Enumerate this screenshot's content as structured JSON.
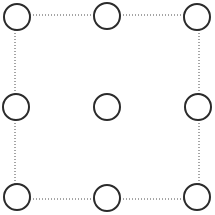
{
  "figure": {
    "name": "nine-point-dotted-square",
    "canvas": {
      "width": 215,
      "height": 215,
      "background_color": "#ffffff"
    },
    "square": {
      "label": "dotted-square-boundary",
      "left": 15,
      "top": 15,
      "right": 199,
      "bottom": 199,
      "stroke_color": "#4a4a4a",
      "stroke_width": 1,
      "dash_pattern": "1 2",
      "edges": [
        {
          "name": "top-edge",
          "x1": 15,
          "y1": 15,
          "x2": 199,
          "y2": 15
        },
        {
          "name": "right-edge",
          "x1": 199,
          "y1": 15,
          "x2": 199,
          "y2": 199
        },
        {
          "name": "bottom-edge",
          "x1": 15,
          "y1": 199,
          "x2": 199,
          "y2": 199
        },
        {
          "name": "left-edge",
          "x1": 15,
          "y1": 15,
          "x2": 15,
          "y2": 199
        }
      ]
    },
    "nodes": {
      "count": 9,
      "grid_rows": 3,
      "grid_cols": 3,
      "radius": 13,
      "stroke_color": "#2b2b2b",
      "stroke_width": 2,
      "fill_color": "#ffffff",
      "items": [
        {
          "id": "node-top-left",
          "row": 0,
          "col": 0,
          "cx": 17,
          "cy": 17,
          "on_boundary": true
        },
        {
          "id": "node-top-center",
          "row": 0,
          "col": 1,
          "cx": 107,
          "cy": 16,
          "on_boundary": true
        },
        {
          "id": "node-top-right",
          "row": 0,
          "col": 2,
          "cx": 197,
          "cy": 17,
          "on_boundary": true
        },
        {
          "id": "node-middle-left",
          "row": 1,
          "col": 0,
          "cx": 16,
          "cy": 107,
          "on_boundary": true
        },
        {
          "id": "node-center",
          "row": 1,
          "col": 1,
          "cx": 107,
          "cy": 107,
          "on_boundary": false
        },
        {
          "id": "node-middle-right",
          "row": 1,
          "col": 2,
          "cx": 198,
          "cy": 107,
          "on_boundary": true
        },
        {
          "id": "node-bottom-left",
          "row": 2,
          "col": 0,
          "cx": 17,
          "cy": 197,
          "on_boundary": true
        },
        {
          "id": "node-bottom-center",
          "row": 2,
          "col": 1,
          "cx": 107,
          "cy": 198,
          "on_boundary": true
        },
        {
          "id": "node-bottom-right",
          "row": 2,
          "col": 2,
          "cx": 197,
          "cy": 197,
          "on_boundary": true
        }
      ]
    }
  }
}
